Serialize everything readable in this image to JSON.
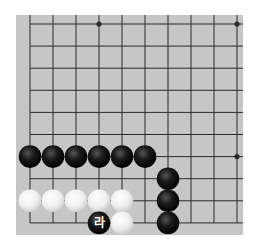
{
  "diagram": {
    "type": "go-board-fragment",
    "colors": {
      "board": "#c6c6c6",
      "line": "#2a2a2a",
      "black_stone": "#111111",
      "white_stone": "#f4f4f4",
      "label_text": "#ffffff"
    },
    "grid": {
      "columns": 10,
      "rows": 10,
      "x0": 30,
      "y0": 24,
      "dx": 23,
      "dy": 22.1,
      "open_edges": [
        "top",
        "right"
      ]
    },
    "star_points": [
      [
        3,
        0
      ],
      [
        9,
        0
      ],
      [
        9,
        6
      ]
    ],
    "stones": [
      {
        "color": "black",
        "col": 0,
        "row": 6
      },
      {
        "color": "black",
        "col": 1,
        "row": 6
      },
      {
        "color": "black",
        "col": 2,
        "row": 6
      },
      {
        "color": "black",
        "col": 3,
        "row": 6
      },
      {
        "color": "black",
        "col": 4,
        "row": 6
      },
      {
        "color": "black",
        "col": 5,
        "row": 6
      },
      {
        "color": "black",
        "col": 6,
        "row": 7
      },
      {
        "color": "black",
        "col": 6,
        "row": 8
      },
      {
        "color": "black",
        "col": 6,
        "row": 9
      },
      {
        "color": "white",
        "col": 0,
        "row": 8
      },
      {
        "color": "white",
        "col": 1,
        "row": 8
      },
      {
        "color": "white",
        "col": 2,
        "row": 8
      },
      {
        "color": "white",
        "col": 3,
        "row": 8
      },
      {
        "color": "white",
        "col": 4,
        "row": 8
      },
      {
        "color": "white",
        "col": 4,
        "row": 9
      },
      {
        "color": "black",
        "col": 3,
        "row": 9,
        "label": "라"
      }
    ]
  }
}
